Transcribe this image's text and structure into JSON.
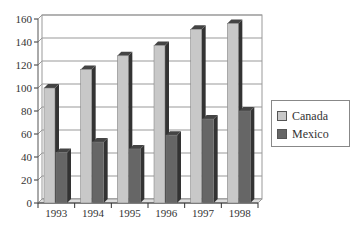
{
  "chart_data": {
    "type": "bar",
    "title": "",
    "xlabel": "",
    "ylabel": "",
    "categories": [
      "1993",
      "1994",
      "1995",
      "1996",
      "1997",
      "1998"
    ],
    "series": [
      {
        "name": "Canada",
        "values": [
          100,
          116,
          128,
          137,
          151,
          156
        ],
        "color": "#c8c8c8"
      },
      {
        "name": "Mexico",
        "values": [
          44,
          53,
          47,
          59,
          73,
          80
        ],
        "color": "#666666"
      }
    ],
    "ylim": [
      0,
      160
    ],
    "yticks": [
      0,
      20,
      40,
      60,
      80,
      100,
      120,
      140,
      160
    ],
    "grid": true,
    "legend_position": "right",
    "style": "3d-bar"
  },
  "legend": {
    "items": [
      {
        "label": "Canada",
        "color": "#c8c8c8"
      },
      {
        "label": "Mexico",
        "color": "#666666"
      }
    ]
  }
}
